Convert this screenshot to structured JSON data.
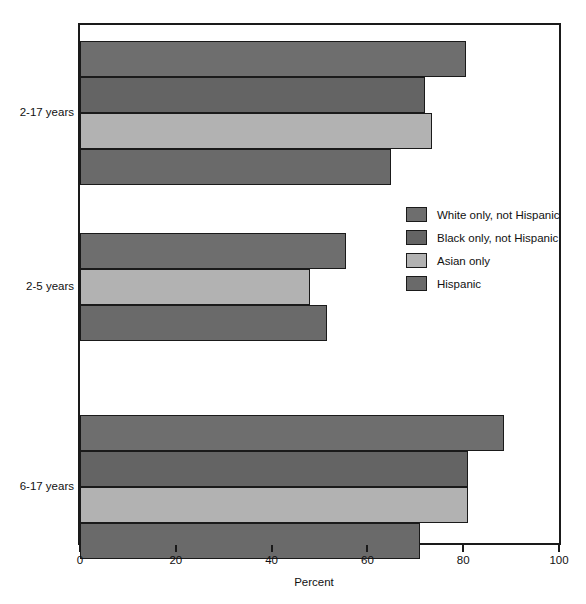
{
  "chart_data": {
    "type": "bar",
    "orientation": "horizontal",
    "title": "",
    "xlabel": "Percent",
    "ylabel": "",
    "xlim": [
      0,
      100
    ],
    "xticks": [
      "0",
      "20",
      "40",
      "60",
      "80",
      "100"
    ],
    "grid": false,
    "legend_position": "center-right",
    "categories": [
      "2-17 years",
      "2-5 years",
      "6-17 years"
    ],
    "series": [
      {
        "name": "White only, not Hispanic",
        "key": "white",
        "color": "#6e6e6e",
        "values": [
          80.5,
          55.5,
          88.5
        ]
      },
      {
        "name": "Black only, not Hispanic",
        "key": "black",
        "color": "#646464",
        "values": [
          72.0,
          null,
          81.0
        ]
      },
      {
        "name": "Asian only",
        "key": "asian",
        "color": "#b2b2b2",
        "values": [
          73.5,
          48.0,
          81.0
        ]
      },
      {
        "name": "Hispanic",
        "key": "hispanic",
        "color": "#6a6a6a",
        "values": [
          65.0,
          51.5,
          71.0
        ]
      }
    ],
    "bars": [
      {
        "group": "2-17 years",
        "series": "White only, not Hispanic",
        "series_key": "white",
        "value": 80.5
      },
      {
        "group": "2-17 years",
        "series": "Black only, not Hispanic",
        "series_key": "black",
        "value": 72.0
      },
      {
        "group": "2-17 years",
        "series": "Asian only",
        "series_key": "asian",
        "value": 73.5
      },
      {
        "group": "2-17 years",
        "series": "Hispanic",
        "series_key": "hispanic",
        "value": 65.0
      },
      {
        "group": "2-5 years",
        "series": "White only, not Hispanic",
        "series_key": "white",
        "value": 55.5
      },
      {
        "group": "2-5 years",
        "series": "Asian only",
        "series_key": "asian",
        "value": 48.0
      },
      {
        "group": "2-5 years",
        "series": "Hispanic",
        "series_key": "hispanic",
        "value": 51.5
      },
      {
        "group": "6-17 years",
        "series": "White only, not Hispanic",
        "series_key": "white",
        "value": 88.5
      },
      {
        "group": "6-17 years",
        "series": "Black only, not Hispanic",
        "series_key": "black",
        "value": 81.0
      },
      {
        "group": "6-17 years",
        "series": "Asian only",
        "series_key": "asian",
        "value": 81.0
      },
      {
        "group": "6-17 years",
        "series": "Hispanic",
        "series_key": "hispanic",
        "value": 71.0
      }
    ]
  },
  "legend": {
    "items": [
      {
        "label": "White only, not Hispanic",
        "key": "white"
      },
      {
        "label": "Black only, not Hispanic",
        "key": "black"
      },
      {
        "label": "Asian only",
        "key": "asian"
      },
      {
        "label": "Hispanic",
        "key": "hispanic"
      }
    ]
  },
  "axis": {
    "x_title": "Percent",
    "x_ticks": [
      "0",
      "20",
      "40",
      "60",
      "80",
      "100"
    ],
    "y_labels": [
      "2-17 years",
      "2-5 years",
      "6-17 years"
    ]
  },
  "colors": {
    "white_series": "#6e6e6e",
    "black_series": "#646464",
    "asian_series": "#b2b2b2",
    "hispanic_series": "#6a6a6a",
    "axis": "#1a1a1a",
    "background": "#ffffff"
  }
}
